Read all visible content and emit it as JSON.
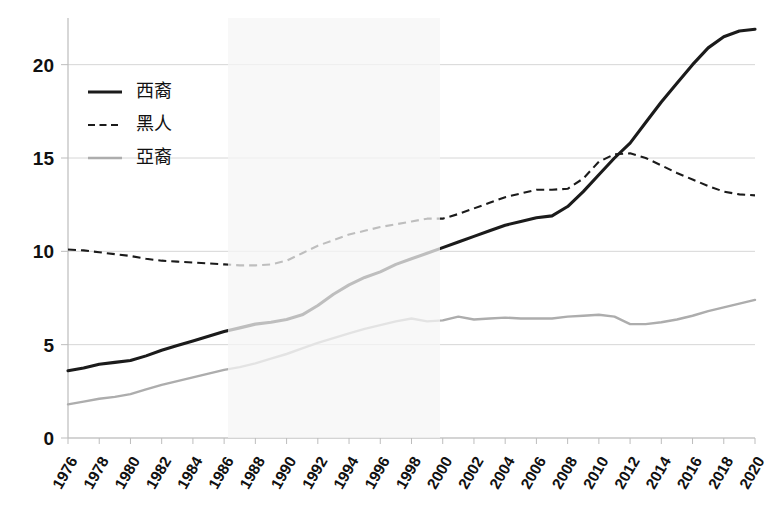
{
  "chart_data": {
    "type": "line",
    "title": "",
    "subtitle": "",
    "xlabel": "",
    "ylabel": "",
    "xlim": [
      1976,
      2020
    ],
    "ylim": [
      0,
      22.5
    ],
    "yticks": [
      0,
      5,
      10,
      15,
      20
    ],
    "grid": "horizontal",
    "legend_position": "upper-left-inside",
    "x": [
      1976,
      1977,
      1978,
      1979,
      1980,
      1981,
      1982,
      1983,
      1984,
      1985,
      1986,
      1987,
      1988,
      1989,
      1990,
      1991,
      1992,
      1993,
      1994,
      1995,
      1996,
      1997,
      1998,
      1999,
      2000,
      2001,
      2002,
      2003,
      2004,
      2005,
      2006,
      2007,
      2008,
      2009,
      2010,
      2011,
      2012,
      2013,
      2014,
      2015,
      2016,
      2017,
      2018,
      2019,
      2020
    ],
    "xtick_labels": [
      "1976",
      "1978",
      "1980",
      "1982",
      "1984",
      "1986",
      "1988",
      "1990",
      "1992",
      "1994",
      "1996",
      "1998",
      "2000",
      "2002",
      "2004",
      "2006",
      "2008",
      "2010",
      "2012",
      "2014",
      "2016",
      "2018",
      "2020"
    ],
    "series": [
      {
        "name": "西裔",
        "style": "solid",
        "color": "#1b1b1b",
        "width": 3.1,
        "values": [
          3.6,
          3.75,
          3.95,
          4.05,
          4.15,
          4.4,
          4.7,
          4.95,
          5.2,
          5.45,
          5.7,
          5.9,
          6.1,
          6.2,
          6.35,
          6.6,
          7.1,
          7.7,
          8.2,
          8.6,
          8.9,
          9.3,
          9.6,
          9.9,
          10.2,
          10.5,
          10.8,
          11.1,
          11.4,
          11.6,
          11.8,
          11.9,
          12.4,
          13.2,
          14.1,
          15.0,
          15.8,
          16.9,
          18.0,
          19.0,
          20.0,
          20.9,
          21.5,
          21.8,
          21.9
        ],
        "label_position": "legend"
      },
      {
        "name": "黑人",
        "style": "dashed",
        "color": "#1b1b1b",
        "width": 2.1,
        "values": [
          10.1,
          10.05,
          9.95,
          9.85,
          9.75,
          9.6,
          9.5,
          9.45,
          9.4,
          9.35,
          9.3,
          9.25,
          9.25,
          9.3,
          9.5,
          9.9,
          10.3,
          10.6,
          10.9,
          11.1,
          11.3,
          11.45,
          11.6,
          11.75,
          11.75,
          12.0,
          12.3,
          12.6,
          12.9,
          13.1,
          13.3,
          13.3,
          13.35,
          13.9,
          14.8,
          15.2,
          15.25,
          15.0,
          14.6,
          14.2,
          13.85,
          13.5,
          13.2,
          13.05,
          13.0
        ],
        "label_position": "legend"
      },
      {
        "name": "亞裔",
        "style": "solid",
        "color": "#adadad",
        "width": 2.4,
        "values": [
          1.8,
          1.95,
          2.1,
          2.2,
          2.35,
          2.6,
          2.85,
          3.05,
          3.25,
          3.45,
          3.65,
          3.8,
          4.0,
          4.25,
          4.5,
          4.8,
          5.1,
          5.35,
          5.6,
          5.85,
          6.05,
          6.25,
          6.4,
          6.25,
          6.3,
          6.5,
          6.35,
          6.4,
          6.45,
          6.4,
          6.4,
          6.4,
          6.5,
          6.55,
          6.6,
          6.5,
          6.1,
          6.1,
          6.2,
          6.35,
          6.55,
          6.8,
          7.0,
          7.2,
          7.4
        ],
        "label_position": "legend"
      }
    ]
  },
  "legend": {
    "entries": [
      {
        "label": "西裔",
        "swatch": "solid-dark-line-icon"
      },
      {
        "label": "黑人",
        "swatch": "dashed-dark-line-icon"
      },
      {
        "label": "亞裔",
        "swatch": "solid-gray-line-icon"
      }
    ]
  },
  "axes": {
    "y_tick_labels": [
      "20",
      "15",
      "10",
      "5",
      "0"
    ],
    "x_tick_labels": [
      "1976",
      "1978",
      "1980",
      "1982",
      "1984",
      "1986",
      "1988",
      "1990",
      "1992",
      "1994",
      "1996",
      "1998",
      "2000",
      "2002",
      "2004",
      "2006",
      "2008",
      "2010",
      "2012",
      "2014",
      "2016",
      "2018",
      "2020"
    ]
  },
  "colors": {
    "hispanic": "#1b1b1b",
    "black": "#1b1b1b",
    "asian": "#adadad",
    "gridline": "#d6d6d6",
    "axis": "#bdbdbd",
    "background": "#ffffff"
  }
}
